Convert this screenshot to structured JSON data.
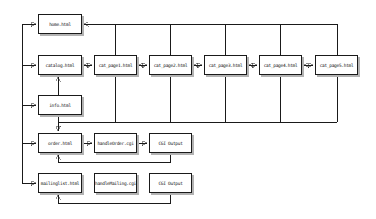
{
  "diagram": {
    "type": "website-structure-flowchart",
    "colors": {
      "background": "#ffffff",
      "box_fill": "#ffffff",
      "box_border": "#1a1a1a",
      "box_shadow": "#b3b3b3",
      "line": "#1a1a1a",
      "text": "#111111"
    },
    "nodes": [
      {
        "id": "home",
        "label": "home.html"
      },
      {
        "id": "catalog",
        "label": "catalog.html"
      },
      {
        "id": "cat_page1",
        "label": "cat_page1.html"
      },
      {
        "id": "cat_page2",
        "label": "cat_page2.html"
      },
      {
        "id": "cat_page3",
        "label": "cat_page3.html"
      },
      {
        "id": "cat_page4",
        "label": "cat_page4.html"
      },
      {
        "id": "cat_page5",
        "label": "cat_page5.html"
      },
      {
        "id": "info",
        "label": "info.html"
      },
      {
        "id": "order",
        "label": "order.html"
      },
      {
        "id": "handle_order",
        "label": "handleOrder.cgi"
      },
      {
        "id": "cgi_output_order",
        "label": "CGI Output"
      },
      {
        "id": "mailinglist",
        "label": "mailinglist.html"
      },
      {
        "id": "handle_mailing",
        "label": "handleMailing.cgi"
      },
      {
        "id": "cgi_output_mailing",
        "label": "CGI Output"
      }
    ],
    "edges": [
      {
        "from": "nav-spine",
        "to": "home.html",
        "type": "arrow"
      },
      {
        "from": "nav-spine",
        "to": "catalog.html",
        "type": "arrow"
      },
      {
        "from": "nav-spine",
        "to": "info.html",
        "type": "arrow"
      },
      {
        "from": "nav-spine",
        "to": "order.html",
        "type": "arrow"
      },
      {
        "from": "nav-spine",
        "to": "mailinglist.html",
        "type": "arrow"
      },
      {
        "from": "catalog.html",
        "to": "cat_page1.html",
        "type": "double-arrow"
      },
      {
        "from": "cat_page1.html",
        "to": "cat_page2.html",
        "type": "double-arrow"
      },
      {
        "from": "cat_page2.html",
        "to": "cat_page3.html",
        "type": "double-arrow"
      },
      {
        "from": "cat_page3.html",
        "to": "cat_page4.html",
        "type": "double-arrow"
      },
      {
        "from": "cat_page4.html",
        "to": "cat_page5.html",
        "type": "double-arrow"
      },
      {
        "from": "cat_page1.html",
        "to": "home.html",
        "type": "arrow"
      },
      {
        "from": "cat_page2.html",
        "to": "home.html",
        "type": "arrow"
      },
      {
        "from": "cat_page3.html",
        "to": "home.html",
        "type": "arrow"
      },
      {
        "from": "cat_page4.html",
        "to": "home.html",
        "type": "arrow"
      },
      {
        "from": "cat_page5.html",
        "to": "home.html",
        "type": "arrow"
      },
      {
        "from": "info.html",
        "to": "catalog.html",
        "type": "arrow"
      },
      {
        "from": "cat_pages-collector",
        "to": "order.html",
        "type": "arrow"
      },
      {
        "from": "info.html",
        "to": "order.html",
        "type": "arrow"
      },
      {
        "from": "order.html",
        "to": "handleOrder.cgi",
        "type": "arrow"
      },
      {
        "from": "handleOrder.cgi",
        "to": "CGI Output",
        "type": "arrow"
      },
      {
        "from": "CGI Output (order row)",
        "to": "order.html",
        "type": "feedback-arrow"
      },
      {
        "from": "CGI Output (mailing row)",
        "to": "mailinglist.html",
        "type": "feedback-arrow"
      }
    ]
  }
}
